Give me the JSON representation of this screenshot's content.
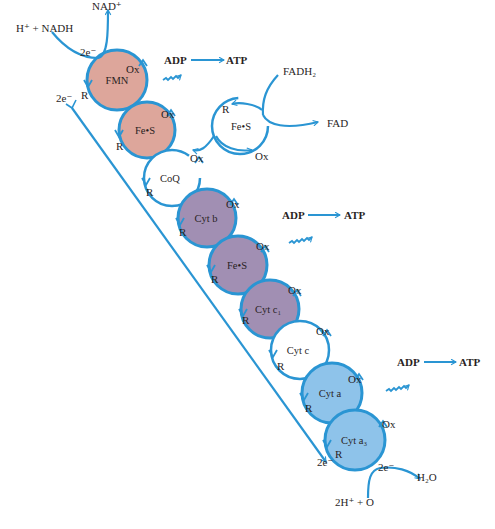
{
  "colors": {
    "arrow": "#2a95d3",
    "flavoprotein_fill": "#dda69b",
    "cytochrome_bc_fill": "#a18fb3",
    "oxidase_fill": "#8ec3ea",
    "carrier_fill": "#ffffff",
    "text": "#2a1f1f"
  },
  "inputs": {
    "nadh": "H⁺ + NADH",
    "nad": "NAD⁺",
    "fadh2": "FADH₂",
    "fad": "FAD",
    "oxygen": "2H⁺ + O",
    "water": "H₂O"
  },
  "electrons": {
    "top_in": "2e⁻",
    "left_start": "2e⁻",
    "bottom_end": "2e⁻",
    "final": "2e⁻"
  },
  "state_labels": {
    "oxidized": "Ox",
    "reduced": "R"
  },
  "carriers": [
    {
      "id": "fmn",
      "label": "FMN"
    },
    {
      "id": "fes1",
      "label": "Fe•S"
    },
    {
      "id": "coq",
      "label": "CoQ"
    },
    {
      "id": "fes_side",
      "label": "Fe•S"
    },
    {
      "id": "cytb",
      "label": "Cyt b"
    },
    {
      "id": "fes2",
      "label": "Fe•S"
    },
    {
      "id": "cytc1",
      "label": "Cyt c₁"
    },
    {
      "id": "cytc",
      "label": "Cyt c"
    },
    {
      "id": "cyta",
      "label": "Cyt a"
    },
    {
      "id": "cyta3",
      "label": "Cyt a₃"
    }
  ],
  "phosphorylation_sites": [
    {
      "adp": "ADP",
      "atp": "ATP"
    },
    {
      "adp": "ADP",
      "atp": "ATP"
    },
    {
      "adp": "ADP",
      "atp": "ATP"
    }
  ]
}
